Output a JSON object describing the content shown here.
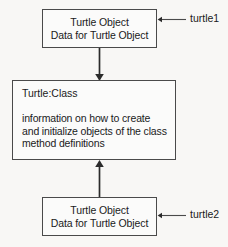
{
  "diagram": {
    "background_color": "#f8f7f5",
    "line_color": "#2b2b2b",
    "box_border_color": "#4a4a4a",
    "box_fill_color": "#fbfbfa",
    "text_color": "#1a1a1a"
  },
  "top_object_box": {
    "line1": "Turtle Object",
    "line2": "Data for Turtle Object"
  },
  "class_box": {
    "title": "Turtle:Class",
    "body": [
      "information on how to create",
      "and initialize objects of the class",
      "method definitions"
    ]
  },
  "bottom_object_box": {
    "line1": "Turtle Object",
    "line2": "Data for Turtle Object"
  },
  "labels": {
    "turtle1": "turtle1",
    "turtle2": "turtle2"
  },
  "connectors": [
    {
      "name": "top-object-to-class",
      "from": "top_object_box",
      "to": "class_box",
      "direction": "down"
    },
    {
      "name": "bottom-object-to-class",
      "from": "bottom_object_box",
      "to": "class_box",
      "direction": "up"
    },
    {
      "name": "turtle1-label-to-top-box",
      "from": "labels.turtle1",
      "to": "top_object_box",
      "direction": "left"
    },
    {
      "name": "turtle2-label-to-bottom-box",
      "from": "labels.turtle2",
      "to": "bottom_object_box",
      "direction": "left"
    }
  ]
}
